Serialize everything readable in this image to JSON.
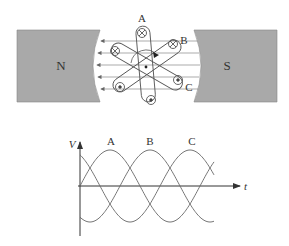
{
  "generator": {
    "north_pole_label": "N",
    "south_pole_label": "S",
    "coil_labels": [
      "A",
      "B",
      "C"
    ],
    "field_lines": 5,
    "colors": {
      "magnet_fill": "#a9a9a9",
      "line": "#555555"
    }
  },
  "waveform": {
    "y_axis_label": "V",
    "x_axis_label": "t",
    "phase_labels": [
      "A",
      "B",
      "C"
    ]
  },
  "chart_data": {
    "type": "line",
    "xlabel": "t",
    "ylabel": "V",
    "series": [
      {
        "name": "A",
        "phase_deg": 0
      },
      {
        "name": "B",
        "phase_deg": -120
      },
      {
        "name": "C",
        "phase_deg": -240
      }
    ],
    "grid": false
  }
}
